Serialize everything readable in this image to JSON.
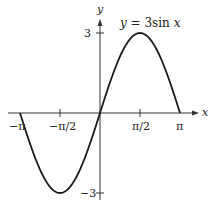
{
  "chart_data": {
    "type": "line",
    "title": "",
    "annotation": "y = 3 sin x",
    "xlabel": "x",
    "ylabel": "y",
    "xlim": [
      -3.14159,
      3.14159
    ],
    "ylim": [
      -3,
      3
    ],
    "x_ticks": [
      "-π",
      "-π/2",
      "π/2",
      "π"
    ],
    "y_ticks": [
      "3",
      "-3"
    ],
    "grid": false,
    "series": [
      {
        "name": "y = 3 sin x",
        "x": [
          -3.14159,
          -2.356,
          -1.5708,
          -0.785,
          0,
          0.785,
          1.5708,
          2.356,
          3.14159
        ],
        "values": [
          0,
          -2.121,
          -3,
          -2.121,
          0,
          2.121,
          3,
          2.121,
          0
        ]
      }
    ]
  },
  "labels": {
    "curve": "y = 3sin x",
    "x_axis": "x",
    "y_axis": "y",
    "tick_neg_pi": "−π",
    "tick_neg_half_pi": "−π/2",
    "tick_half_pi": "π/2",
    "tick_pi": "π",
    "tick_3": "3",
    "tick_neg3": "−3"
  }
}
